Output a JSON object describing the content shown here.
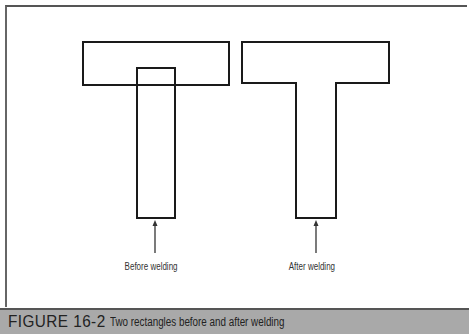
{
  "figure": {
    "number": "FIGURE 16-2",
    "caption": "Two rectangles before and after welding"
  },
  "diagram": {
    "before": {
      "label": "Before welding",
      "shapes": [
        {
          "name": "horizontal-rectangle",
          "x": 83,
          "y": 42,
          "w": 146,
          "h": 43
        },
        {
          "name": "vertical-rectangle",
          "x": 137,
          "y": 68,
          "w": 38,
          "h": 150
        }
      ]
    },
    "after": {
      "label": "After welding",
      "shape": "welded T outline"
    }
  },
  "colors": {
    "stroke": "#1a1a1a",
    "caption_band": "#a9a9a9"
  }
}
